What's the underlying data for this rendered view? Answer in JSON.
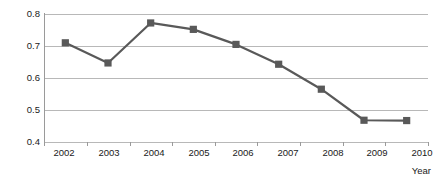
{
  "chart_data": {
    "type": "line",
    "title": "",
    "subtitle": "",
    "xlabel": "Year",
    "ylabel": "",
    "categories": [
      "2002",
      "2003",
      "2004",
      "2005",
      "2006",
      "2007",
      "2008",
      "2009",
      "2010"
    ],
    "values": [
      0.71,
      0.647,
      0.772,
      0.752,
      0.705,
      0.643,
      0.565,
      0.468,
      0.467
    ],
    "series": [
      {
        "name": "",
        "values": [
          0.71,
          0.647,
          0.772,
          0.752,
          0.705,
          0.643,
          0.565,
          0.468,
          0.467
        ]
      }
    ],
    "ylim": [
      0.4,
      0.8
    ],
    "y_ticks": [
      0.4,
      0.5,
      0.6,
      0.7,
      0.8
    ],
    "y_tick_labels": [
      "0.4",
      "0.5",
      "0.6",
      "0.7",
      "0.8"
    ],
    "x_tick_labels": [
      "2002",
      "2003",
      "2004",
      "2005",
      "2006",
      "2007",
      "2008",
      "2009",
      "2010"
    ],
    "grid": true,
    "grid_axis": "y",
    "legend": false,
    "legend_position": "none",
    "markers": "square",
    "annotations": []
  },
  "style": {
    "series_color": "#595959",
    "marker_color": "#595959",
    "gridline_color": "#b8b8b8",
    "axis_color": "#9a9a9a",
    "background_color": "#ffffff",
    "text_color": "#1a1a1a"
  },
  "axis_titles": {
    "x": "Year",
    "y": ""
  }
}
